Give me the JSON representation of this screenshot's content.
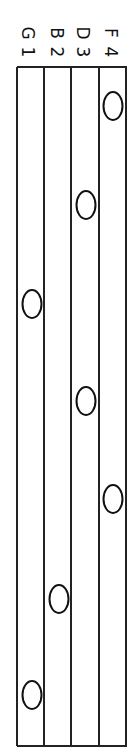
{
  "staff": {
    "orientation": "rotated-90-clockwise",
    "line_x": [
      17,
      44,
      71,
      98,
      125
    ],
    "top": 67,
    "bottom": 746
  },
  "labels": [
    {
      "letter": "G",
      "number": "1",
      "x": 27
    },
    {
      "letter": "B",
      "number": "2",
      "x": 56
    },
    {
      "letter": "D",
      "number": "3",
      "x": 82
    },
    {
      "letter": "F",
      "number": "4",
      "x": 110
    }
  ],
  "notes": [
    {
      "space": "F4",
      "x": 113,
      "y": 106
    },
    {
      "space": "D3",
      "x": 86,
      "y": 205
    },
    {
      "space": "G1",
      "x": 32,
      "y": 304
    },
    {
      "space": "D3",
      "x": 86,
      "y": 401
    },
    {
      "space": "F4",
      "x": 113,
      "y": 499
    },
    {
      "space": "B2",
      "x": 59,
      "y": 599
    },
    {
      "space": "G1",
      "x": 32,
      "y": 695
    }
  ]
}
